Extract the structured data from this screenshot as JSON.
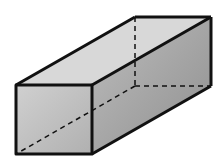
{
  "diagram": {
    "colors": {
      "edge": "#111111",
      "front": "#c4c4c4",
      "top": "#d6d6d6",
      "side": "#a8a8a8"
    }
  }
}
